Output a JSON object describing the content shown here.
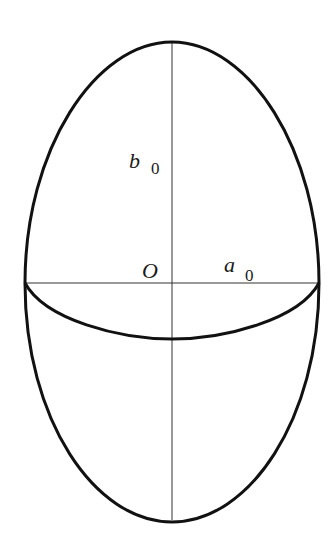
{
  "diagram": {
    "type": "ellipsoid-cross-section",
    "colors": {
      "background": "#ffffff",
      "outline": "#111111",
      "axis": "#333333",
      "text": "#1a1a1a"
    },
    "labels": {
      "origin": "O",
      "semi_minor": {
        "symbol": "a",
        "subscript": "0"
      },
      "semi_major": {
        "symbol": "b",
        "subscript": "0"
      }
    },
    "geometry": {
      "center": [
        172,
        283
      ],
      "outer_ellipse": {
        "rx": 147,
        "ry": 240
      },
      "equator_ellipse": {
        "rx": 147,
        "ry": 56,
        "front_half_only": true
      }
    }
  }
}
